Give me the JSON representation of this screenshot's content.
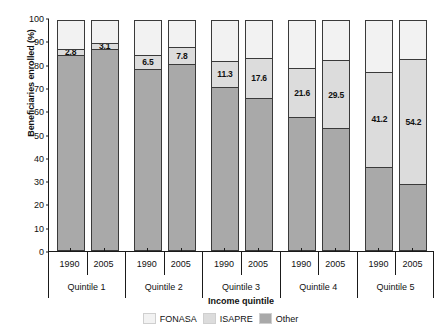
{
  "chart_data": {
    "type": "bar",
    "subtype": "stacked-vertical-100",
    "title": "",
    "xlabel": "Income quintile",
    "ylabel": "Beneficiaries enrolled (%)",
    "ylim": [
      0,
      100
    ],
    "yticks": [
      0,
      10,
      20,
      30,
      40,
      50,
      60,
      70,
      80,
      90,
      100
    ],
    "grid": false,
    "legend_position": "bottom-right",
    "groups": [
      "Quintile 1",
      "Quintile 2",
      "Quintile 3",
      "Quintile 4",
      "Quintile 5"
    ],
    "years": [
      "1990",
      "2005"
    ],
    "categories": [
      "Quintile 1 1990",
      "Quintile 1 2005",
      "Quintile 2 1990",
      "Quintile 2 2005",
      "Quintile 3 1990",
      "Quintile 3 2005",
      "Quintile 4 1990",
      "Quintile 4 2005",
      "Quintile 5 1990",
      "Quintile 5 2005"
    ],
    "series": [
      {
        "name": "FONASA",
        "color": "#a9a9a9",
        "values": [
          84.3,
          86.8,
          78.1,
          80.1,
          70.5,
          65.8,
          57.5,
          52.7,
          36.2,
          28.8
        ]
      },
      {
        "name": "ISAPRE",
        "color": "#dcdcdc",
        "labeled": true,
        "values": [
          2.8,
          3.1,
          6.5,
          7.8,
          11.3,
          17.6,
          21.6,
          29.5,
          41.2,
          54.2
        ]
      },
      {
        "name": "Other",
        "color": "#f2f2f2",
        "values": [
          12.9,
          10.1,
          15.4,
          12.1,
          18.2,
          16.6,
          20.9,
          17.8,
          22.6,
          17.0
        ]
      }
    ],
    "data_labels": [
      "2.8",
      "3.1",
      "6.5",
      "7.8",
      "11.3",
      "17.6",
      "21.6",
      "29.5",
      "41.2",
      "54.2"
    ]
  },
  "legend": {
    "items": [
      {
        "label": "FONASA",
        "swatch": "s-fonasa"
      },
      {
        "label": "ISAPRE",
        "swatch": "s-isapre"
      },
      {
        "label": "Other",
        "swatch": "s-other"
      }
    ]
  }
}
